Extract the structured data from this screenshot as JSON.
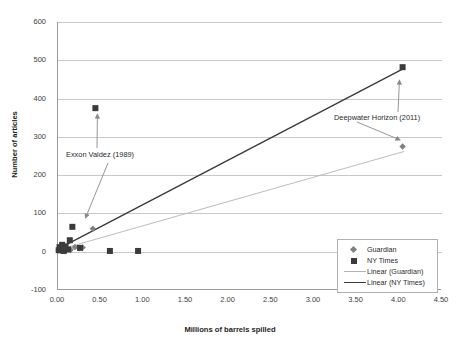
{
  "chart_data": {
    "type": "scatter",
    "title": "",
    "xlabel": "Millions of barrels spilled",
    "ylabel": "Number of articles",
    "xlim": [
      0.0,
      4.5
    ],
    "ylim": [
      -100,
      600
    ],
    "xticks": [
      "0.00",
      "0.50",
      "1.00",
      "1.50",
      "2.00",
      "2.50",
      "3.00",
      "3.50",
      "4.00",
      "4.50"
    ],
    "xtick_values": [
      0.0,
      0.5,
      1.0,
      1.5,
      2.0,
      2.5,
      3.0,
      3.5,
      4.0,
      4.5
    ],
    "yticks": [
      "-100",
      "0",
      "100",
      "200",
      "300",
      "400",
      "500",
      "600"
    ],
    "ytick_values": [
      -100,
      0,
      100,
      200,
      300,
      400,
      500,
      600
    ],
    "grid": "horizontal",
    "legend_position": "bottom-right",
    "series": [
      {
        "name": "Guardian",
        "marker": "diamond",
        "color": "#808080",
        "points": [
          {
            "x": 0.02,
            "y": 3
          },
          {
            "x": 0.04,
            "y": 6
          },
          {
            "x": 0.05,
            "y": 2
          },
          {
            "x": 0.07,
            "y": 10
          },
          {
            "x": 0.09,
            "y": 4
          },
          {
            "x": 0.12,
            "y": 8
          },
          {
            "x": 0.16,
            "y": 5
          },
          {
            "x": 0.21,
            "y": 12
          },
          {
            "x": 0.26,
            "y": 9
          },
          {
            "x": 0.3,
            "y": 11
          },
          {
            "x": 0.42,
            "y": 60
          },
          {
            "x": 4.05,
            "y": 275
          }
        ]
      },
      {
        "name": "NY Times",
        "marker": "square",
        "color": "#3b3b3b",
        "points": [
          {
            "x": 0.02,
            "y": 4
          },
          {
            "x": 0.03,
            "y": 12
          },
          {
            "x": 0.05,
            "y": 8
          },
          {
            "x": 0.06,
            "y": 18
          },
          {
            "x": 0.08,
            "y": 2
          },
          {
            "x": 0.1,
            "y": 14
          },
          {
            "x": 0.13,
            "y": 6
          },
          {
            "x": 0.15,
            "y": 30
          },
          {
            "x": 0.18,
            "y": 65
          },
          {
            "x": 0.27,
            "y": 10
          },
          {
            "x": 0.45,
            "y": 375
          },
          {
            "x": 0.62,
            "y": 2
          },
          {
            "x": 0.95,
            "y": 2
          },
          {
            "x": 4.05,
            "y": 482
          }
        ]
      }
    ],
    "trendlines": [
      {
        "name": "Linear (Guardian)",
        "color": "#b4b4b4",
        "x1": 0.02,
        "y1": 5,
        "x2": 4.07,
        "y2": 262
      },
      {
        "name": "Linear (NY Times)",
        "color": "#3b3b3b",
        "x1": 0.02,
        "y1": 8,
        "x2": 4.06,
        "y2": 478
      }
    ],
    "annotations": [
      {
        "text": "Exxon Valdez (1989)",
        "target_x": 0.45,
        "target_y": 375,
        "second_target_x": 0.3,
        "second_target_y": 75
      },
      {
        "text": "Deepwater Horizon (2011)",
        "target_x": 4.03,
        "target_y": 282,
        "second_target_x": 3.97,
        "second_target_y": 452
      }
    ],
    "legend": [
      {
        "label": "Guardian",
        "key": "marker-diamond"
      },
      {
        "label": "NY Times",
        "key": "marker-square"
      },
      {
        "label": "Linear (Guardian)",
        "key": "line-light"
      },
      {
        "label": "Linear (NY Times)",
        "key": "line-dark"
      }
    ]
  }
}
